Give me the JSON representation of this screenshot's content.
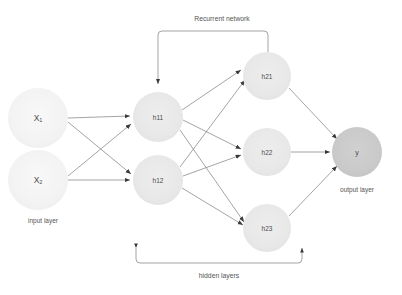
{
  "figure": {
    "type": "neural-network-diagram",
    "title": "",
    "background_color": "#ffffff"
  },
  "colors": {
    "input_node": "#f4f4f4",
    "hidden_node": "#e9e9e9",
    "output_node": "#cacaca",
    "edge": "#7d7d7d",
    "bracket": "#9a9a9a",
    "label_text": "#4a4a4a",
    "caption_text": "#555555"
  },
  "layers": {
    "input": {
      "caption": "input layer",
      "nodes": [
        {
          "id": "x1",
          "base": "X",
          "subscript": "1",
          "cx": 38,
          "cy": 118,
          "r": 30
        },
        {
          "id": "x2",
          "base": "X",
          "subscript": "2",
          "cx": 38,
          "cy": 180,
          "r": 30
        }
      ]
    },
    "hidden_1": {
      "nodes": [
        {
          "id": "h11",
          "label": "h11",
          "cx": 158,
          "cy": 117,
          "r": 25
        },
        {
          "id": "h12",
          "label": "h12",
          "cx": 158,
          "cy": 180,
          "r": 25
        }
      ]
    },
    "hidden_2": {
      "nodes": [
        {
          "id": "h21",
          "label": "h21",
          "cx": 267,
          "cy": 76,
          "r": 24
        },
        {
          "id": "h22",
          "label": "h22",
          "cx": 267,
          "cy": 152,
          "r": 24
        },
        {
          "id": "h23",
          "label": "h23",
          "cx": 267,
          "cy": 228,
          "r": 24
        }
      ]
    },
    "output": {
      "caption": "output layer",
      "nodes": [
        {
          "id": "y",
          "label": "y",
          "cx": 357,
          "cy": 152,
          "r": 25
        }
      ]
    }
  },
  "annotations": {
    "recurrent": {
      "label": "Recurrent network",
      "description": "feedback connection from h21 back to h11"
    },
    "hidden_layers": {
      "label": "hidden layers",
      "description": "bracket spanning hidden layer 1 and hidden layer 2"
    }
  },
  "connections": [
    {
      "from": "x1",
      "to": "h11"
    },
    {
      "from": "x1",
      "to": "h12"
    },
    {
      "from": "x2",
      "to": "h11"
    },
    {
      "from": "x2",
      "to": "h12"
    },
    {
      "from": "h11",
      "to": "h21"
    },
    {
      "from": "h11",
      "to": "h22"
    },
    {
      "from": "h11",
      "to": "h23"
    },
    {
      "from": "h12",
      "to": "h21"
    },
    {
      "from": "h12",
      "to": "h22"
    },
    {
      "from": "h12",
      "to": "h23"
    },
    {
      "from": "h21",
      "to": "y"
    },
    {
      "from": "h22",
      "to": "y"
    },
    {
      "from": "h23",
      "to": "y"
    },
    {
      "from": "h21",
      "to": "h11",
      "kind": "recurrent"
    }
  ]
}
